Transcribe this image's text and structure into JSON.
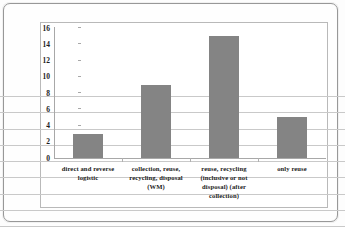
{
  "chart_data": {
    "type": "bar",
    "title": "",
    "xlabel": "",
    "ylabel": "",
    "categories": [
      "direct and reverse logistic",
      "collection, reuse, recycling, disposal (WM)",
      "reuse, recycling (inclusive or not disposal) (after collection)",
      "only reuse"
    ],
    "values": [
      3,
      9,
      15,
      5
    ],
    "ylim": [
      0,
      16
    ],
    "ytick_labels": [
      "0",
      "2",
      "4",
      "6",
      "8",
      "10",
      "12",
      "14",
      "16"
    ],
    "ytick_values": [
      0,
      2,
      4,
      6,
      8,
      10,
      12,
      14,
      16
    ],
    "grid": true,
    "legend": false,
    "bar_color": "#848484",
    "gridline_color": "#c9c9c9",
    "axis_color": "#a8a8a8",
    "plot_background": "#ffffff"
  }
}
